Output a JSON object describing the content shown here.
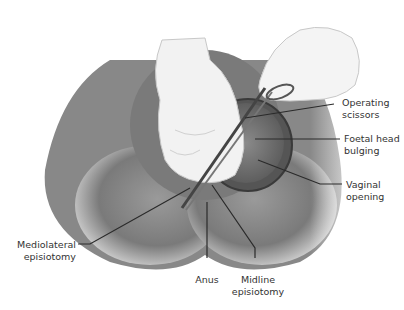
{
  "figure": {
    "type": "anatomical illustration"
  },
  "labels": {
    "operating_scissors": [
      "Operating",
      "scissors"
    ],
    "foetal_head": [
      "Foetal head",
      "bulging"
    ],
    "vaginal_opening": [
      "Vaginal",
      "opening"
    ],
    "mediolateral": [
      "Mediolateral",
      "episiotomy"
    ],
    "anus": [
      "Anus"
    ],
    "midline": [
      "Midline",
      "episiotomy"
    ]
  },
  "colors": {
    "leader_line": "#2a2a2a",
    "text": "#333333",
    "skin_shadow": "#6e6e6e",
    "glove": "#f2f2f2"
  }
}
